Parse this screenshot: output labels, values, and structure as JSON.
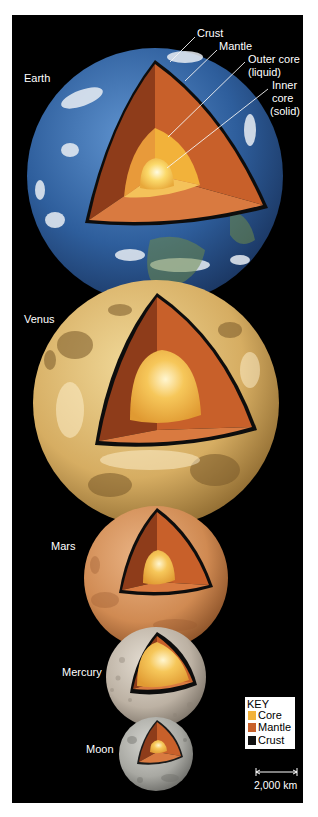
{
  "figure": {
    "background": "#000000",
    "page_background": "#ffffff"
  },
  "planets": [
    {
      "name": "Earth",
      "label": "Earth"
    },
    {
      "name": "Venus",
      "label": "Venus"
    },
    {
      "name": "Mars",
      "label": "Mars"
    },
    {
      "name": "Mercury",
      "label": "Mercury"
    },
    {
      "name": "Moon",
      "label": "Moon"
    }
  ],
  "earth_layers": {
    "crust": "Crust",
    "mantle": "Mantle",
    "outer_core_line1": "Outer core",
    "outer_core_line2": "(liquid)",
    "inner_core_line1": "Inner",
    "inner_core_line2": "core",
    "inner_core_line3": "(solid)"
  },
  "key": {
    "title": "KEY",
    "items": [
      {
        "label": "Core",
        "color": "#f2b23a"
      },
      {
        "label": "Mantle",
        "color": "#c8602a"
      },
      {
        "label": "Crust",
        "color": "#111111"
      }
    ]
  },
  "scale_bar": {
    "label": "2,000 km"
  },
  "colors": {
    "core": "#f2b23a",
    "outer_core": "#f4c25a",
    "inner_core": "#fde27a",
    "mantle": "#c8602a",
    "mantle_shadow": "#8e3c1a",
    "crust": "#111111",
    "earth": "#3a6fb0",
    "venus": "#d9b46a",
    "mars": "#d7925a",
    "mercury": "#bdb3a6",
    "moon": "#a9a9a4"
  }
}
